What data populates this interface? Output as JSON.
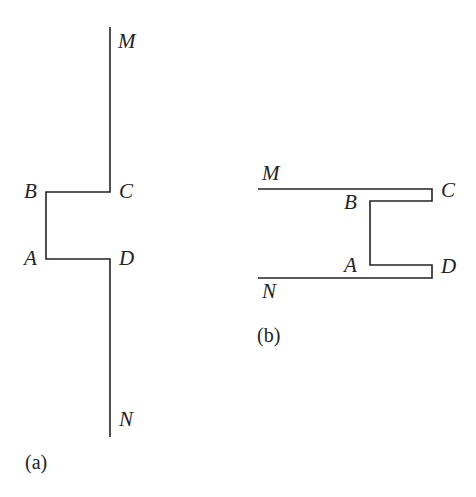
{
  "figure": {
    "background_color": "#ffffff",
    "stroke_color": "#232323",
    "stroke_width": 1.6,
    "panels": [
      {
        "key": "a",
        "caption": "(a)",
        "orientation": "vertical",
        "description": "Vertical crack line M-C-B-A-D-N with rectangular notch opening to the left",
        "labels": [
          {
            "key": "M",
            "text": "M"
          },
          {
            "key": "B",
            "text": "B"
          },
          {
            "key": "C",
            "text": "C"
          },
          {
            "key": "A",
            "text": "A"
          },
          {
            "key": "D",
            "text": "D"
          },
          {
            "key": "N",
            "text": "N"
          }
        ],
        "path_points": [
          {
            "name": "M-end",
            "x": 110,
            "y": 27
          },
          {
            "name": "C-corner",
            "x": 110,
            "y": 192
          },
          {
            "name": "B-corner",
            "x": 46,
            "y": 192
          },
          {
            "name": "A-corner",
            "x": 46,
            "y": 259
          },
          {
            "name": "D-corner",
            "x": 110,
            "y": 259
          },
          {
            "name": "N-end",
            "x": 110,
            "y": 437
          }
        ]
      },
      {
        "key": "b",
        "caption": "(b)",
        "orientation": "horizontal",
        "description": "Two horizontal lines M-C and N-D joined by a C-shaped channel through B and A, with closed end caps at C and D",
        "labels": [
          {
            "key": "M",
            "text": "M"
          },
          {
            "key": "C",
            "text": "C"
          },
          {
            "key": "B",
            "text": "B"
          },
          {
            "key": "A",
            "text": "A"
          },
          {
            "key": "D",
            "text": "D"
          },
          {
            "key": "N",
            "text": "N"
          }
        ],
        "upper_path_points": [
          {
            "name": "M-end",
            "x": 258,
            "y": 189
          },
          {
            "name": "C-top",
            "x": 432,
            "y": 189
          },
          {
            "name": "C-bottom",
            "x": 432,
            "y": 201
          },
          {
            "name": "B-corner",
            "x": 370,
            "y": 201
          },
          {
            "name": "A-corner",
            "x": 370,
            "y": 265
          },
          {
            "name": "D-top",
            "x": 432,
            "y": 265
          },
          {
            "name": "D-bottom",
            "x": 432,
            "y": 278
          },
          {
            "name": "N-end",
            "x": 258,
            "y": 278
          }
        ]
      }
    ]
  }
}
